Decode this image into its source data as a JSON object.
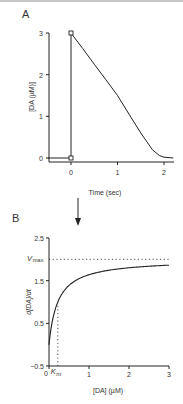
{
  "chart_data": [
    {
      "panel_label": "A",
      "type": "line",
      "title": "",
      "xlabel": "Time (sec)",
      "ylabel": "[DA (µM)]",
      "xlim": [
        -0.5,
        2.2
      ],
      "ylim": [
        -0.1,
        3
      ],
      "xticks": [
        0,
        1,
        2
      ],
      "xtick_labels": [
        "0",
        "1",
        "2"
      ],
      "yticks": [
        0,
        1,
        2,
        3
      ],
      "ytick_labels": [
        "0",
        "1",
        "2",
        "3"
      ],
      "grid": false,
      "series": [
        {
          "name": "stimulus",
          "x": [
            -0.5,
            0,
            0,
            0
          ],
          "y": [
            0,
            0,
            3,
            3
          ]
        },
        {
          "name": "clearance",
          "x": [
            0,
            0.25,
            0.5,
            0.75,
            1.0,
            1.25,
            1.5,
            1.75,
            1.9,
            2.0,
            2.2
          ],
          "y": [
            3,
            2.63,
            2.25,
            1.88,
            1.5,
            1.05,
            0.6,
            0.2,
            0.06,
            0.02,
            0
          ]
        }
      ],
      "markers": [
        {
          "x": 0,
          "y": 0,
          "shape": "square"
        },
        {
          "x": 0,
          "y": 3,
          "shape": "square"
        }
      ]
    },
    {
      "panel_label": "B",
      "type": "line",
      "title": "",
      "xlabel": "[DA] (µM)",
      "ylabel": "d[DA]/dt",
      "xlim": [
        0,
        3
      ],
      "ylim": [
        -0.5,
        2.5
      ],
      "xticks": [
        0,
        1,
        2,
        3
      ],
      "xtick_labels": [
        "0",
        "1",
        "2",
        "3"
      ],
      "yticks": [
        -0.5,
        0.5,
        1.5,
        2.5
      ],
      "ytick_labels": [
        "−0.5",
        "0.5",
        "1.5",
        "2.5"
      ],
      "grid": false,
      "series": [
        {
          "name": "Michaelis-Menten",
          "function": "Vmax*x/(Km+x)",
          "Vmax": 2,
          "Km": 0.22,
          "x_range": [
            0,
            3
          ]
        }
      ],
      "annotations": [
        {
          "text": "V",
          "subscript": "max",
          "type": "horizontal-dotted",
          "y": 2
        },
        {
          "text": "K",
          "subscript": "m",
          "type": "vertical-dotted",
          "x": 0.22
        }
      ]
    }
  ],
  "arrow": {
    "direction": "down",
    "meaning": "A-to-B"
  }
}
